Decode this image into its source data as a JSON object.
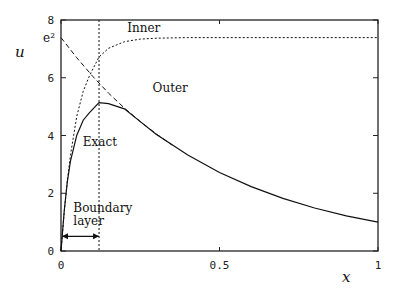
{
  "chart_data": {
    "type": "line",
    "title": "",
    "xlabel": "x",
    "ylabel": "u",
    "xlim": [
      0,
      1
    ],
    "ylim": [
      0,
      8
    ],
    "grid": false,
    "x_ticks": [
      {
        "value": 0,
        "label": "0"
      },
      {
        "value": 0.5,
        "label": "0.5"
      },
      {
        "value": 1,
        "label": "1"
      }
    ],
    "y_ticks": [
      {
        "value": 0,
        "label": "0"
      },
      {
        "value": 2,
        "label": "2"
      },
      {
        "value": 4,
        "label": "4"
      },
      {
        "value": 6,
        "label": "6"
      },
      {
        "value": 8,
        "label": "8"
      }
    ],
    "y_special_tick": {
      "value": 7.389,
      "label": "e²"
    },
    "series": [
      {
        "name": "Exact",
        "style": "solid",
        "x": [
          0,
          0.01,
          0.02,
          0.03,
          0.05,
          0.07,
          0.09,
          0.12,
          0.15,
          0.2,
          0.25,
          0.3,
          0.4,
          0.5,
          0.6,
          0.7,
          0.8,
          0.9,
          1.0
        ],
        "values": [
          0,
          1.38,
          2.39,
          3.12,
          4.01,
          4.53,
          4.79,
          5.14,
          5.1,
          4.92,
          4.48,
          4.04,
          3.32,
          2.72,
          2.23,
          1.82,
          1.49,
          1.22,
          1.0
        ]
      },
      {
        "name": "Outer",
        "style": "dashed",
        "x": [
          0,
          0.05,
          0.1,
          0.15,
          0.2,
          0.25,
          0.3,
          0.35
        ],
        "values": [
          7.389,
          6.69,
          6.05,
          5.47,
          4.95,
          4.48,
          4.06,
          3.67
        ]
      },
      {
        "name": "Inner",
        "style": "dotted",
        "x": [
          0,
          0.01,
          0.02,
          0.03,
          0.05,
          0.07,
          0.09,
          0.12,
          0.15,
          0.2,
          0.25,
          0.3,
          0.4,
          0.6,
          0.8,
          1.0
        ],
        "values": [
          0,
          1.34,
          2.43,
          3.33,
          4.67,
          5.53,
          6.07,
          6.72,
          7.02,
          7.25,
          7.34,
          7.37,
          7.389,
          7.389,
          7.389,
          7.389
        ]
      }
    ],
    "annotations": [
      {
        "text": "Inner",
        "x": 0.19,
        "y": 7.6
      },
      {
        "text": "Outer",
        "x": 0.27,
        "y": 5.5
      },
      {
        "text": "Exact",
        "x": 0.05,
        "y": 3.65
      },
      {
        "text": "Boundary",
        "x": 0.02,
        "y": 1.35
      },
      {
        "text": "layer",
        "x": 0.02,
        "y": 0.9
      }
    ],
    "boundary_layer": {
      "x_start": 0,
      "x_end": 0.12,
      "arrow_y": 0.75,
      "label": "Boundary layer"
    }
  }
}
